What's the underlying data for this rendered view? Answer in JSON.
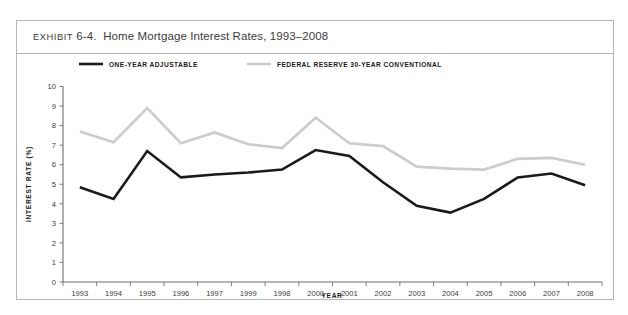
{
  "exhibit": {
    "label": "EXHIBIT",
    "number": "6-4.",
    "title": "Home Mortgage Interest Rates, 1993–2008",
    "full_title": "EXHIBIT 6-4.  Home Mortgage Interest Rates, 1993–2008"
  },
  "colors": {
    "one_year_adjustable": "#1a1a1a",
    "federal_reserve_30_year": "#cccccc",
    "axis": "#6e6e6e",
    "frame_border": "#b5b5b5",
    "text": "#231f20",
    "background": "#ffffff"
  },
  "chart_data": {
    "type": "line",
    "title": "Home Mortgage Interest Rates, 1993–2008",
    "xlabel": "YEAR",
    "ylabel": "INTEREST RATE (%)",
    "ylim": [
      0,
      10
    ],
    "ytick_labels": [
      "10",
      "9",
      "8",
      "7",
      "6",
      "5",
      "4",
      "3",
      "2",
      "1",
      "0"
    ],
    "ytick_values": [
      10,
      9,
      8,
      7,
      6,
      5,
      4,
      3,
      2,
      1,
      0
    ],
    "grid": false,
    "legend_position": "top-inside",
    "categories": [
      "1993",
      "1994",
      "1995",
      "1996",
      "1997",
      "1999",
      "1998",
      "2000",
      "2001",
      "2002",
      "2003",
      "2004",
      "2005",
      "2006",
      "2007",
      "2008"
    ],
    "series": [
      {
        "name": "ONE-YEAR ADJUSTABLE",
        "color": "#1a1a1a",
        "line_width": 2.6,
        "values": [
          4.85,
          4.25,
          6.7,
          5.35,
          5.5,
          5.6,
          5.75,
          6.75,
          6.45,
          5.1,
          3.9,
          3.55,
          4.25,
          5.35,
          5.55,
          4.95
        ]
      },
      {
        "name": "FEDERAL RESERVE 30-YEAR CONVENTIONAL",
        "color": "#cccccc",
        "line_width": 2.6,
        "values": [
          7.7,
          7.15,
          8.9,
          7.1,
          7.65,
          7.05,
          6.85,
          8.4,
          7.1,
          6.95,
          5.9,
          5.8,
          5.75,
          6.3,
          6.35,
          6.0
        ]
      }
    ]
  }
}
